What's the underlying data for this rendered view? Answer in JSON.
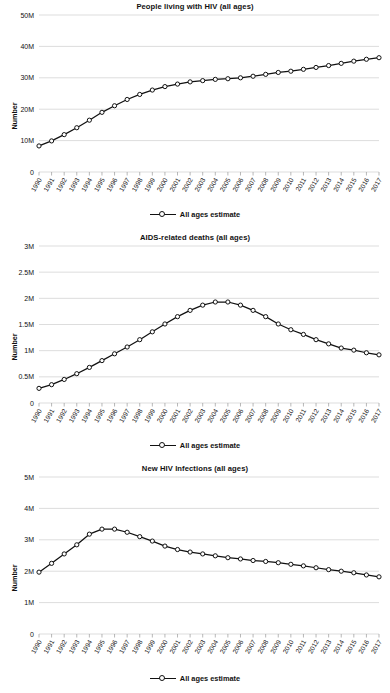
{
  "page": {
    "background_color": "#ffffff",
    "line_color": "#111111",
    "grid_color": "#cfcfcf",
    "marker_fill": "#ffffff"
  },
  "legend": {
    "label": "All ages estimate",
    "marker_icon": "line-circle-marker-icon"
  },
  "axis_label": "Number",
  "years": [
    "1990",
    "1991",
    "1992",
    "1993",
    "1994",
    "1995",
    "1996",
    "1997",
    "1998",
    "1999",
    "2000",
    "2001",
    "2002",
    "2003",
    "2004",
    "2005",
    "2006",
    "2007",
    "2008",
    "2009",
    "2010",
    "2011",
    "2012",
    "2013",
    "2014",
    "2015",
    "2016",
    "2017"
  ],
  "chart_data": [
    {
      "type": "line",
      "title": "People living with HIV (all ages)",
      "xlabel": "",
      "ylabel": "Number",
      "ylim": [
        0,
        50000000
      ],
      "yticks": [
        0,
        10000000,
        20000000,
        30000000,
        40000000,
        50000000
      ],
      "ytick_labels": [
        "0",
        "10M",
        "20M",
        "30M",
        "40M",
        "50M"
      ],
      "grid": true,
      "legend_position": "bottom",
      "x": [
        "1990",
        "1991",
        "1992",
        "1993",
        "1994",
        "1995",
        "1996",
        "1997",
        "1998",
        "1999",
        "2000",
        "2001",
        "2002",
        "2003",
        "2004",
        "2005",
        "2006",
        "2007",
        "2008",
        "2009",
        "2010",
        "2011",
        "2012",
        "2013",
        "2014",
        "2015",
        "2016",
        "2017"
      ],
      "series": [
        {
          "name": "All ages estimate",
          "values": [
            8300000,
            9900000,
            11900000,
            14100000,
            16500000,
            19000000,
            21100000,
            23100000,
            24700000,
            26100000,
            27200000,
            28000000,
            28700000,
            29100000,
            29500000,
            29700000,
            30000000,
            30500000,
            31100000,
            31700000,
            32100000,
            32700000,
            33300000,
            33900000,
            34600000,
            35300000,
            35900000,
            36400000
          ]
        }
      ]
    },
    {
      "type": "line",
      "title": "AIDS-related deaths (all ages)",
      "xlabel": "",
      "ylabel": "Number",
      "ylim": [
        0,
        3000000
      ],
      "yticks": [
        0,
        500000,
        1000000,
        1500000,
        2000000,
        2500000,
        3000000
      ],
      "ytick_labels": [
        "0",
        "0.5M",
        "1M",
        "1.5M",
        "2M",
        "2.5M",
        "3M"
      ],
      "grid": true,
      "legend_position": "bottom",
      "x": [
        "1990",
        "1991",
        "1992",
        "1993",
        "1994",
        "1995",
        "1996",
        "1997",
        "1998",
        "1999",
        "2000",
        "2001",
        "2002",
        "2003",
        "2004",
        "2005",
        "2006",
        "2007",
        "2008",
        "2009",
        "2010",
        "2011",
        "2012",
        "2013",
        "2014",
        "2015",
        "2016",
        "2017"
      ],
      "series": [
        {
          "name": "All ages estimate",
          "values": [
            280000,
            350000,
            450000,
            560000,
            680000,
            810000,
            940000,
            1070000,
            1210000,
            1360000,
            1510000,
            1650000,
            1770000,
            1870000,
            1930000,
            1930000,
            1870000,
            1770000,
            1650000,
            1510000,
            1400000,
            1310000,
            1210000,
            1130000,
            1050000,
            1010000,
            960000,
            920000
          ]
        }
      ]
    },
    {
      "type": "line",
      "title": "New HIV Infections (all ages)",
      "xlabel": "",
      "ylabel": "Number",
      "ylim": [
        0,
        5000000
      ],
      "yticks": [
        0,
        1000000,
        2000000,
        3000000,
        4000000,
        5000000
      ],
      "ytick_labels": [
        "0",
        "1M",
        "2M",
        "3M",
        "4M",
        "5M"
      ],
      "grid": true,
      "legend_position": "bottom",
      "x": [
        "1990",
        "1991",
        "1992",
        "1993",
        "1994",
        "1995",
        "1996",
        "1997",
        "1998",
        "1999",
        "2000",
        "2001",
        "2002",
        "2003",
        "2004",
        "2005",
        "2006",
        "2007",
        "2008",
        "2009",
        "2010",
        "2011",
        "2012",
        "2013",
        "2014",
        "2015",
        "2016",
        "2017"
      ],
      "series": [
        {
          "name": "All ages estimate",
          "values": [
            1970000,
            2250000,
            2550000,
            2840000,
            3180000,
            3340000,
            3340000,
            3240000,
            3100000,
            2960000,
            2800000,
            2690000,
            2610000,
            2550000,
            2490000,
            2430000,
            2390000,
            2340000,
            2310000,
            2270000,
            2220000,
            2170000,
            2110000,
            2050000,
            2000000,
            1950000,
            1880000,
            1820000
          ]
        }
      ]
    }
  ]
}
